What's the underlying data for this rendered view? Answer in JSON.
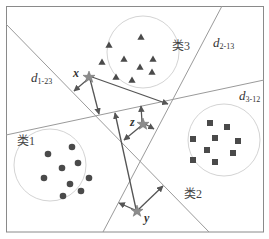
{
  "diagram": {
    "title": "",
    "colors": {
      "frame": "#8a8a8a",
      "boundary": "#9a9a9a",
      "circle": "#d4d4d4",
      "marker": "#4a4a4a",
      "arrow": "#555555",
      "star": "#8c8c8c"
    },
    "classes": [
      {
        "label": "类1",
        "marker": "circle",
        "center": [
          50,
          165
        ],
        "radius": 36,
        "points": [
          [
            72,
            147
          ],
          [
            48,
            154
          ],
          [
            78,
            163
          ],
          [
            62,
            168
          ],
          [
            44,
            178
          ],
          [
            89,
            178
          ],
          [
            70,
            184
          ],
          [
            81,
            191
          ],
          [
            63,
            196
          ]
        ]
      },
      {
        "label": "类2",
        "marker": "square",
        "center": [
          224,
          140
        ],
        "radius": 36,
        "points": [
          [
            210,
            123
          ],
          [
            227,
            127
          ],
          [
            193,
            139
          ],
          [
            215,
            138
          ],
          [
            238,
            141
          ],
          [
            207,
            150
          ],
          [
            233,
            153
          ],
          [
            193,
            160
          ],
          [
            215,
            162
          ]
        ]
      },
      {
        "label": "类3",
        "marker": "triangle",
        "center": [
          143,
          52
        ],
        "radius": 36,
        "points": [
          [
            109,
            45
          ],
          [
            141,
            37
          ],
          [
            102,
            62
          ],
          [
            124,
            59
          ],
          [
            153,
            59
          ],
          [
            140,
            67
          ],
          [
            152,
            72
          ],
          [
            116,
            77
          ],
          [
            132,
            80
          ]
        ]
      }
    ],
    "boundaries": [
      {
        "label": "d",
        "sub": "1-23",
        "from": [
          6,
          24
        ],
        "to": [
          209,
          232
        ]
      },
      {
        "label": "d",
        "sub": "2-13",
        "from": [
          222,
          6
        ],
        "to": [
          103,
          232
        ]
      },
      {
        "label": "d",
        "sub": "3-12",
        "from": [
          6,
          135
        ],
        "to": [
          264,
          80
        ]
      }
    ],
    "points": [
      {
        "label": "x",
        "pos": [
          89,
          77
        ]
      },
      {
        "label": "z",
        "pos": [
          143,
          124
        ]
      },
      {
        "label": "y",
        "pos": [
          137,
          211
        ]
      }
    ],
    "labels": {
      "class1": "类1",
      "class2": "类2",
      "class3": "类3",
      "d_main": "d",
      "d1_sub": "1-23",
      "d2_sub": "2-13",
      "d3_sub": "3-12",
      "x": "x",
      "y": "y",
      "z": "z"
    }
  }
}
